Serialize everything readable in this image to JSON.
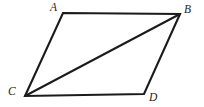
{
  "figure": {
    "kind": "geometry-diagram",
    "shape_name": "parallelogram",
    "canvas": {
      "width": 204,
      "height": 107,
      "background": "#ffffff"
    },
    "stroke_color": "#1b1b1b",
    "label_color": "#232323",
    "vertices": [
      {
        "id": "A",
        "label": "A",
        "x": 63,
        "y": 13,
        "label_x": 50,
        "label_y": 2
      },
      {
        "id": "B",
        "label": "B",
        "x": 180,
        "y": 14,
        "label_x": 184,
        "label_y": 4
      },
      {
        "id": "C",
        "label": "C",
        "x": 25,
        "y": 96,
        "label_x": 8,
        "label_y": 86
      },
      {
        "id": "D",
        "label": "D",
        "x": 144,
        "y": 94,
        "label_x": 149,
        "label_y": 92
      }
    ],
    "edges": [
      {
        "id": "AB",
        "from": "A",
        "to": "B",
        "role": "side-top"
      },
      {
        "id": "BD",
        "from": "B",
        "to": "D",
        "role": "side-right"
      },
      {
        "id": "DC",
        "from": "D",
        "to": "C",
        "role": "side-bottom"
      },
      {
        "id": "CA",
        "from": "C",
        "to": "A",
        "role": "side-left"
      }
    ],
    "diagonals": [
      {
        "id": "CB",
        "from": "C",
        "to": "B",
        "role": "diagonal"
      }
    ],
    "outline_points": "63,13 180,14 144,94 25,96",
    "diagonal_points": "25,96 180,14"
  }
}
